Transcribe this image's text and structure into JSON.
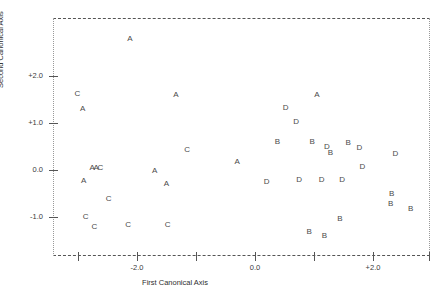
{
  "chart_data": {
    "type": "scatter",
    "title": "",
    "xlabel": "First Canonical Axis",
    "ylabel": "Second Canonical Axis",
    "xlim": [
      -3.4,
      2.95
    ],
    "ylim": [
      -1.6,
      3.0
    ],
    "grid": false,
    "legend": "none",
    "point_label_mode": "group-letter",
    "xticks": [
      -3.0,
      -2.0,
      -1.0,
      0.0,
      1.0,
      2.0,
      2.95
    ],
    "xticklabels": [
      "",
      "-2.0",
      "",
      "0.0",
      "",
      "+2.0",
      ""
    ],
    "yticks": [
      2.0,
      1.0,
      0.0,
      -1.0
    ],
    "yticklabels": [
      "+2.0",
      "+1.0",
      "0.0",
      "-1.0"
    ],
    "groups": [
      "A",
      "B",
      "C",
      "D"
    ],
    "series": [
      {
        "name": "A",
        "label": "A",
        "points": [
          {
            "x": -2.12,
            "y": 2.78
          },
          {
            "x": -2.92,
            "y": 1.3
          },
          {
            "x": -1.34,
            "y": 1.6
          },
          {
            "x": 1.05,
            "y": 1.6
          },
          {
            "x": -2.76,
            "y": 0.04
          },
          {
            "x": -2.69,
            "y": 0.04
          },
          {
            "x": -1.7,
            "y": -0.02
          },
          {
            "x": -0.3,
            "y": 0.16
          },
          {
            "x": -2.9,
            "y": -0.24
          },
          {
            "x": -1.5,
            "y": -0.29
          }
        ]
      },
      {
        "name": "B",
        "label": "B",
        "points": [
          {
            "x": 0.38,
            "y": 0.6
          },
          {
            "x": 0.97,
            "y": 0.6
          },
          {
            "x": 1.58,
            "y": 0.58
          },
          {
            "x": 1.28,
            "y": 0.37
          },
          {
            "x": 2.32,
            "y": -0.51
          },
          {
            "x": 2.3,
            "y": -0.73
          },
          {
            "x": 2.64,
            "y": -0.83
          },
          {
            "x": 1.44,
            "y": -1.05
          },
          {
            "x": 0.92,
            "y": -1.32
          },
          {
            "x": 1.18,
            "y": -1.4
          }
        ]
      },
      {
        "name": "C",
        "label": "C",
        "points": [
          {
            "x": -3.01,
            "y": 1.62
          },
          {
            "x": -2.62,
            "y": 0.04
          },
          {
            "x": -1.15,
            "y": 0.42
          },
          {
            "x": -2.48,
            "y": -0.62
          },
          {
            "x": -2.87,
            "y": -1.0
          },
          {
            "x": -2.72,
            "y": -1.22
          },
          {
            "x": -2.15,
            "y": -1.18
          },
          {
            "x": -1.48,
            "y": -1.17
          }
        ]
      },
      {
        "name": "D",
        "label": "D",
        "points": [
          {
            "x": 0.52,
            "y": 1.32
          },
          {
            "x": 0.7,
            "y": 1.02
          },
          {
            "x": 1.22,
            "y": 0.5
          },
          {
            "x": 1.77,
            "y": 0.46
          },
          {
            "x": 2.38,
            "y": 0.33
          },
          {
            "x": 1.82,
            "y": 0.07
          },
          {
            "x": 0.2,
            "y": -0.25
          },
          {
            "x": 0.75,
            "y": -0.22
          },
          {
            "x": 1.13,
            "y": -0.22
          },
          {
            "x": 1.48,
            "y": -0.22
          }
        ]
      }
    ]
  },
  "axes": {
    "x_title": "First Canonical Axis",
    "y_title": "Second Canonical Axis",
    "y_labels": [
      "+2.0",
      "+1.0",
      "0.0",
      "-1.0"
    ],
    "x_labels": [
      "-2.0",
      "0.0",
      "+2.0"
    ]
  },
  "colors": {
    "frame": "#555555",
    "point": "#4a4a4a",
    "text": "#2e2e2e",
    "background": "#ffffff"
  }
}
